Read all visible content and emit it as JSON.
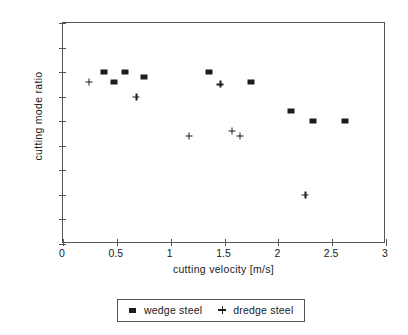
{
  "chart_data": {
    "type": "scatter",
    "title": "",
    "xlabel": "cutting velocity [m/s]",
    "ylabel": "cutting mode ratio",
    "xlim": [
      0,
      3
    ],
    "ylim": [
      0.65,
      1.1
    ],
    "xticks": [
      "0",
      "0.5",
      "1",
      "1.5",
      "2",
      "2.5",
      "3"
    ],
    "xtick_values": [
      0,
      0.5,
      1,
      1.5,
      2,
      2.5,
      3
    ],
    "yticks": [
      "0.65",
      "0.7",
      "0.75",
      "0.8",
      "0.85",
      "0.9",
      "0.95",
      "1",
      "1.05",
      "1.1"
    ],
    "ytick_values": [
      0.65,
      0.7,
      0.75,
      0.8,
      0.85,
      0.9,
      0.95,
      1.0,
      1.05,
      1.1
    ],
    "grid": false,
    "legend_position": "bottom-center",
    "marker_color": "#1c1c1c",
    "series": [
      {
        "name": "wedge steel",
        "marker": "square",
        "points": [
          {
            "x": 0.38,
            "y": 1.0
          },
          {
            "x": 0.47,
            "y": 0.98
          },
          {
            "x": 0.58,
            "y": 1.0
          },
          {
            "x": 0.75,
            "y": 0.99
          },
          {
            "x": 1.36,
            "y": 1.0
          },
          {
            "x": 1.75,
            "y": 0.98
          },
          {
            "x": 2.12,
            "y": 0.92
          },
          {
            "x": 2.32,
            "y": 0.9
          },
          {
            "x": 2.62,
            "y": 0.9
          }
        ]
      },
      {
        "name": "dredge steel",
        "marker": "plus",
        "points": [
          {
            "x": 0.24,
            "y": 0.98
          },
          {
            "x": 0.68,
            "y": 0.95
          },
          {
            "x": 1.17,
            "y": 0.87
          },
          {
            "x": 1.46,
            "y": 0.975
          },
          {
            "x": 1.57,
            "y": 0.88
          },
          {
            "x": 1.64,
            "y": 0.87
          },
          {
            "x": 2.25,
            "y": 0.75
          }
        ]
      }
    ]
  },
  "legend": {
    "entries": [
      {
        "label": "wedge steel",
        "marker": "square"
      },
      {
        "label": "dredge steel",
        "marker": "plus"
      }
    ]
  }
}
